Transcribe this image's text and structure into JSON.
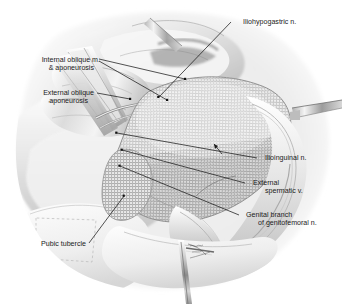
{
  "illustration": {
    "title": "Inguinal hernia repair with prosthetic mesh",
    "modality": "grayscale medical line-and-wash illustration",
    "background_color": "#ffffff",
    "ink_color": "#1b1b1b",
    "tissue_tones": [
      "#ffffff",
      "#f2f2f2",
      "#e4e4e4",
      "#d2d2d2",
      "#bdbdbd",
      "#a6a6a6",
      "#8d8d8d"
    ],
    "mesh": {
      "name": "prosthetic-mesh-patch",
      "pattern": "woven cross-hatch grid",
      "grid_pitch_px": 3,
      "thread_color": "#9a9a9a"
    }
  },
  "labels": {
    "iliohypogastric": {
      "line1": "Iliohypogastric n.",
      "line2": "",
      "side": "right"
    },
    "internal_oblique": {
      "line1": "Internal oblique m.",
      "line2": "& aponeurosis",
      "side": "left"
    },
    "external_oblique": {
      "line1": "External oblique",
      "line2": "aponeurosis",
      "side": "left"
    },
    "ilioinguinal": {
      "line1": "Ilioinguinal n.",
      "line2": "",
      "side": "right"
    },
    "external_spermatic": {
      "line1": "External",
      "line2": "spermatic v.",
      "side": "right"
    },
    "genital_branch": {
      "line1": "Genital branch",
      "line2": "of genitofemoral n.",
      "side": "right"
    },
    "pubic_tubercle": {
      "line1": "Pubic tubercle",
      "line2": "",
      "side": "left"
    }
  },
  "leader_lines": [
    {
      "name": "leader-iliohypogastric",
      "from": [
        232,
        22
      ],
      "to": [
        158,
        97
      ],
      "dot": [
        158,
        97
      ]
    },
    {
      "name": "leader-internal-oblique-a",
      "from": [
        98,
        60
      ],
      "to": [
        185,
        79
      ],
      "dot": [
        185,
        79
      ]
    },
    {
      "name": "leader-internal-oblique-b",
      "from": [
        98,
        61
      ],
      "to": [
        167,
        100
      ],
      "dot": [
        167,
        100
      ]
    },
    {
      "name": "leader-external-oblique",
      "from": [
        96,
        93
      ],
      "to": [
        131,
        99
      ],
      "dot": [
        131,
        99
      ]
    },
    {
      "name": "leader-ilioinguinal",
      "from": [
        258,
        158
      ],
      "to": [
        116,
        133
      ],
      "dot": [
        116,
        133
      ]
    },
    {
      "name": "leader-external-spermatic",
      "from": [
        246,
        183
      ],
      "to": [
        122,
        150
      ],
      "dot": [
        122,
        150
      ]
    },
    {
      "name": "leader-genital-branch",
      "from": [
        240,
        216
      ],
      "to": [
        119,
        166
      ],
      "dot": [
        119,
        166
      ]
    },
    {
      "name": "leader-pubic-tubercle",
      "from": [
        88,
        243
      ],
      "to": [
        124,
        196
      ],
      "dot": [
        124,
        196
      ]
    }
  ],
  "instruments": [
    {
      "name": "retractor-blade-right",
      "location": "right margin, mid-height"
    },
    {
      "name": "forceps-bottom",
      "location": "bottom center"
    },
    {
      "name": "retractor-blade-upper",
      "location": "upper center"
    }
  ]
}
